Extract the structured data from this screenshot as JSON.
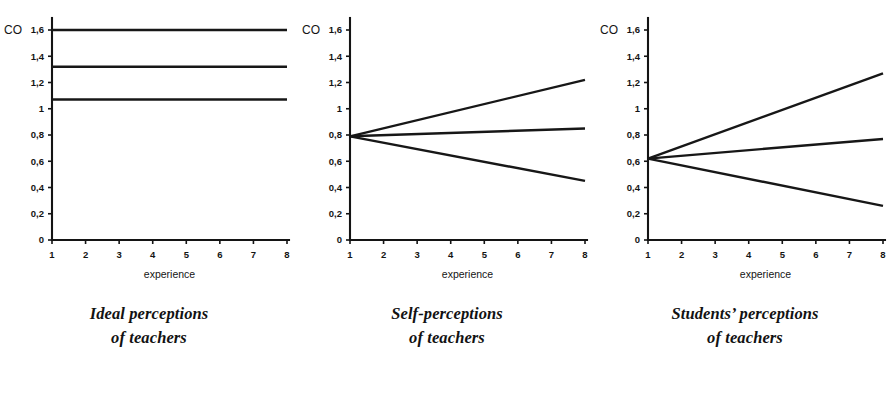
{
  "figure": {
    "panels": [
      {
        "caption_line1": "Ideal perceptions",
        "caption_line2": "of teachers",
        "y_axis_name": "CO",
        "x_axis_title": "experience"
      },
      {
        "caption_line1": "Self-perceptions",
        "caption_line2": "of teachers",
        "y_axis_name": "CO",
        "x_axis_title": "experience"
      },
      {
        "caption_line1": "Students’ perceptions",
        "caption_line2": "of teachers",
        "y_axis_name": "CO",
        "x_axis_title": "experience"
      }
    ]
  },
  "chart_data": [
    {
      "type": "line",
      "title": "Ideal perceptions of teachers",
      "xlabel": "experience",
      "ylabel": "CO",
      "x": [
        1,
        8
      ],
      "xlim": [
        1,
        8
      ],
      "ylim": [
        0,
        1.6
      ],
      "xticks": [
        1,
        2,
        3,
        4,
        5,
        6,
        7,
        8
      ],
      "xticklabels": [
        "1",
        "2",
        "3",
        "4",
        "5",
        "6",
        "7",
        "8"
      ],
      "yticks": [
        0,
        0.2,
        0.4,
        0.6,
        0.8,
        1.0,
        1.2,
        1.4,
        1.6
      ],
      "yticklabels": [
        "0",
        "0,2",
        "0,4",
        "0,6",
        "0,8",
        "1",
        "1,2",
        "1,4",
        "1,6"
      ],
      "grid": false,
      "legend": "none",
      "series": [
        {
          "name": "line-1",
          "values": [
            1.6,
            1.6
          ]
        },
        {
          "name": "line-2",
          "values": [
            1.32,
            1.32
          ]
        },
        {
          "name": "line-3",
          "values": [
            1.07,
            1.07
          ]
        }
      ]
    },
    {
      "type": "line",
      "title": "Self-perceptions of teachers",
      "xlabel": "experience",
      "ylabel": "CO",
      "x": [
        1,
        8
      ],
      "xlim": [
        1,
        8
      ],
      "ylim": [
        0,
        1.6
      ],
      "xticks": [
        1,
        2,
        3,
        4,
        5,
        6,
        7,
        8
      ],
      "xticklabels": [
        "1",
        "2",
        "3",
        "4",
        "5",
        "6",
        "7",
        "8"
      ],
      "yticks": [
        0,
        0.2,
        0.4,
        0.6,
        0.8,
        1.0,
        1.2,
        1.4,
        1.6
      ],
      "yticklabels": [
        "0",
        "0,2",
        "0,4",
        "0,6",
        "0,8",
        "1",
        "1,2",
        "1,4",
        "1,6"
      ],
      "grid": false,
      "legend": "none",
      "series": [
        {
          "name": "line-1",
          "values": [
            0.79,
            1.22
          ]
        },
        {
          "name": "line-2",
          "values": [
            0.79,
            0.85
          ]
        },
        {
          "name": "line-3",
          "values": [
            0.79,
            0.45
          ]
        }
      ]
    },
    {
      "type": "line",
      "title": "Students’ perceptions of teachers",
      "xlabel": "experience",
      "ylabel": "CO",
      "x": [
        1,
        8
      ],
      "xlim": [
        1,
        8
      ],
      "ylim": [
        0,
        1.6
      ],
      "xticks": [
        1,
        2,
        3,
        4,
        5,
        6,
        7,
        8
      ],
      "xticklabels": [
        "1",
        "2",
        "3",
        "4",
        "5",
        "6",
        "7",
        "8"
      ],
      "yticks": [
        0,
        0.2,
        0.4,
        0.6,
        0.8,
        1.0,
        1.2,
        1.4,
        1.6
      ],
      "yticklabels": [
        "0",
        "0,2",
        "0,4",
        "0,6",
        "0,8",
        "1",
        "1,2",
        "1,4",
        "1,6"
      ],
      "grid": false,
      "legend": "none",
      "series": [
        {
          "name": "line-1",
          "values": [
            0.62,
            1.27
          ]
        },
        {
          "name": "line-2",
          "values": [
            0.62,
            0.77
          ]
        },
        {
          "name": "line-3",
          "values": [
            0.62,
            0.26
          ]
        }
      ]
    }
  ]
}
